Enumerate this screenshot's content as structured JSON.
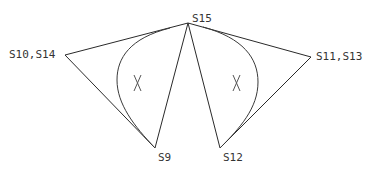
{
  "diagram": {
    "type": "geometric-node-diagram",
    "colors": {
      "line": "#2a2a2a",
      "curve": "#3a3a3a",
      "label": "#333333",
      "background": "#ffffff"
    },
    "nodes": [
      {
        "id": "S15",
        "label": "S15",
        "x": 188,
        "y": 23
      },
      {
        "id": "S10_S14",
        "label": "S10,S14",
        "x": 65,
        "y": 55
      },
      {
        "id": "S11_S13",
        "label": "S11,S13",
        "x": 311,
        "y": 57
      },
      {
        "id": "S9",
        "label": "S9",
        "x": 155,
        "y": 148
      },
      {
        "id": "S12",
        "label": "S12",
        "x": 220,
        "y": 148
      }
    ],
    "edges": [
      {
        "from": "S15",
        "to": "S10_S14"
      },
      {
        "from": "S10_S14",
        "to": "S9"
      },
      {
        "from": "S9",
        "to": "S15"
      },
      {
        "from": "S15",
        "to": "S11_S13"
      },
      {
        "from": "S11_S13",
        "to": "S12"
      },
      {
        "from": "S12",
        "to": "S15"
      }
    ],
    "regions": [
      {
        "id": "left-region",
        "mark": "X",
        "bounded_by": [
          "S15",
          "S9"
        ],
        "x": 137,
        "y": 83
      },
      {
        "id": "right-region",
        "mark": "X",
        "bounded_by": [
          "S15",
          "S12"
        ],
        "x": 236,
        "y": 83
      }
    ],
    "labels": {
      "top": "S15",
      "left": "S10,S14",
      "right": "S11,S13",
      "bottom_left": "S9",
      "bottom_right": "S12",
      "left_mark": "X",
      "right_mark": "X"
    }
  }
}
